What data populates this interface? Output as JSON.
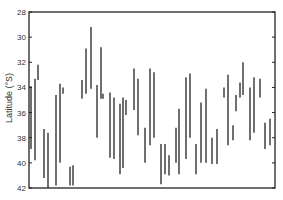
{
  "chart_data": {
    "type": "range-bar",
    "title": "",
    "xlabel": "",
    "ylabel": "Latitude (°S)",
    "ylim": [
      28,
      42
    ],
    "y_inverted": true,
    "yticks": [
      28,
      30,
      32,
      34,
      36,
      38,
      40,
      42
    ],
    "grid": false,
    "legend": null,
    "series": [
      {
        "name": "latitude range",
        "color": "#333333",
        "bars": [
          {
            "x": 31,
            "y0": 33.9,
            "y1": 38.9
          },
          {
            "x": 35,
            "y0": 33.3,
            "y1": 39.8
          },
          {
            "x": 38,
            "y0": 32.2,
            "y1": 33.4
          },
          {
            "x": 44,
            "y0": 37.3,
            "y1": 41.2
          },
          {
            "x": 48,
            "y0": 37.6,
            "y1": 42.0
          },
          {
            "x": 56,
            "y0": 34.6,
            "y1": 41.8
          },
          {
            "x": 60,
            "y0": 33.7,
            "y1": 40.0
          },
          {
            "x": 63,
            "y0": 34.0,
            "y1": 34.5
          },
          {
            "x": 70,
            "y0": 40.3,
            "y1": 41.8
          },
          {
            "x": 73,
            "y0": 40.2,
            "y1": 41.8
          },
          {
            "x": 82,
            "y0": 33.4,
            "y1": 34.9
          },
          {
            "x": 86,
            "y0": 30.9,
            "y1": 34.5
          },
          {
            "x": 91,
            "y0": 29.2,
            "y1": 34.1
          },
          {
            "x": 97,
            "y0": 33.8,
            "y1": 38.0
          },
          {
            "x": 101,
            "y0": 30.8,
            "y1": 34.9
          },
          {
            "x": 103,
            "y0": 34.5,
            "y1": 34.9
          },
          {
            "x": 110,
            "y0": 34.4,
            "y1": 39.6
          },
          {
            "x": 114,
            "y0": 34.8,
            "y1": 39.7
          },
          {
            "x": 120,
            "y0": 35.3,
            "y1": 40.9
          },
          {
            "x": 123,
            "y0": 34.8,
            "y1": 40.4
          },
          {
            "x": 126,
            "y0": 35.0,
            "y1": 36.2
          },
          {
            "x": 134,
            "y0": 32.5,
            "y1": 35.8
          },
          {
            "x": 138,
            "y0": 33.3,
            "y1": 37.8
          },
          {
            "x": 145,
            "y0": 37.2,
            "y1": 40.0
          },
          {
            "x": 150,
            "y0": 32.5,
            "y1": 38.6
          },
          {
            "x": 154,
            "y0": 32.8,
            "y1": 38.0
          },
          {
            "x": 161,
            "y0": 38.5,
            "y1": 41.7
          },
          {
            "x": 165,
            "y0": 38.5,
            "y1": 40.9
          },
          {
            "x": 169,
            "y0": 39.4,
            "y1": 41.0
          },
          {
            "x": 176,
            "y0": 37.2,
            "y1": 40.0
          },
          {
            "x": 179,
            "y0": 35.7,
            "y1": 40.9
          },
          {
            "x": 186,
            "y0": 33.2,
            "y1": 39.7
          },
          {
            "x": 190,
            "y0": 32.9,
            "y1": 38.0
          },
          {
            "x": 196,
            "y0": 38.5,
            "y1": 40.9
          },
          {
            "x": 201,
            "y0": 35.2,
            "y1": 40.0
          },
          {
            "x": 206,
            "y0": 34.1,
            "y1": 40.0
          },
          {
            "x": 212,
            "y0": 38.0,
            "y1": 40.1
          },
          {
            "x": 217,
            "y0": 37.3,
            "y1": 40.1
          },
          {
            "x": 224,
            "y0": 34.0,
            "y1": 34.8
          },
          {
            "x": 228,
            "y0": 33.0,
            "y1": 38.6
          },
          {
            "x": 233,
            "y0": 37.0,
            "y1": 38.2
          },
          {
            "x": 236,
            "y0": 34.6,
            "y1": 35.9
          },
          {
            "x": 240,
            "y0": 33.6,
            "y1": 34.8
          },
          {
            "x": 243,
            "y0": 32.0,
            "y1": 34.6
          },
          {
            "x": 250,
            "y0": 34.0,
            "y1": 38.2
          },
          {
            "x": 254,
            "y0": 33.2,
            "y1": 37.6
          },
          {
            "x": 260,
            "y0": 33.3,
            "y1": 34.8
          },
          {
            "x": 265,
            "y0": 36.8,
            "y1": 38.9
          },
          {
            "x": 270,
            "y0": 36.5,
            "y1": 38.6
          }
        ]
      }
    ]
  },
  "layout": {
    "plot_left": 29,
    "plot_right": 275,
    "plot_top": 12,
    "plot_bottom": 188,
    "axis_color": "#222222",
    "bar_color": "#333333"
  }
}
